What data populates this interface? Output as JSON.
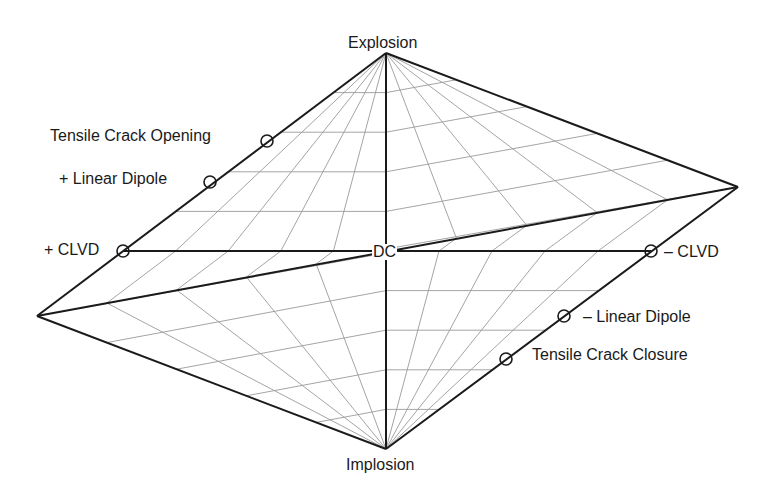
{
  "diagram": {
    "colors": {
      "background": "#ffffff",
      "edge": "#1a1a1a",
      "grid": "#9a9a9a",
      "text": "#1a1a1a"
    },
    "vertices": {
      "top": [
        386,
        53
      ],
      "bottom": [
        386,
        449
      ],
      "left": [
        37,
        316
      ],
      "right": [
        738,
        187
      ],
      "dc": [
        386,
        251
      ],
      "plus_clvd": [
        123,
        251
      ],
      "minus_clvd": [
        651,
        251
      ]
    },
    "labels": {
      "explosion": "Explosion",
      "implosion": "Implosion",
      "dc": "DC",
      "plus_clvd": "+ CLVD",
      "minus_clvd": "– CLVD",
      "plus_linear_dipole": "+ Linear Dipole",
      "minus_linear_dipole": "– Linear Dipole",
      "tensile_crack_opening": "Tensile Crack Opening",
      "tensile_crack_closure": "Tensile Crack Closure"
    },
    "markers": [
      {
        "name": "tensile-crack-opening",
        "x": 267,
        "y": 141
      },
      {
        "name": "plus-linear-dipole",
        "x": 210,
        "y": 182
      },
      {
        "name": "plus-clvd",
        "x": 123,
        "y": 251
      },
      {
        "name": "minus-clvd",
        "x": 651,
        "y": 251
      },
      {
        "name": "minus-linear-dipole",
        "x": 564,
        "y": 316
      },
      {
        "name": "tensile-crack-closure",
        "x": 506,
        "y": 359
      }
    ],
    "grid": {
      "radial_fractions": [
        0.2,
        0.4,
        0.6,
        0.8
      ],
      "level_fractions": [
        0.2,
        0.4,
        0.6,
        0.8
      ]
    }
  }
}
